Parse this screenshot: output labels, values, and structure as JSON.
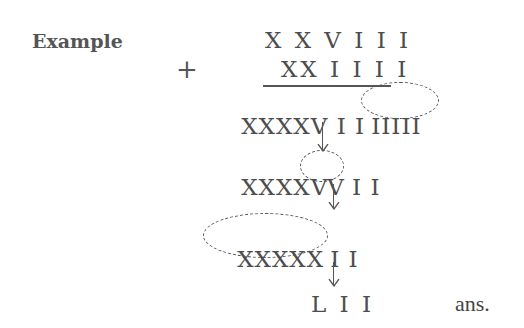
{
  "title": "Example",
  "operator": "+",
  "rows": {
    "addend1": "X X V I I I",
    "addend2": "XX I I I I",
    "sum_raw_prefix": "XXXXV I I",
    "sum_raw_circled": "IIIII",
    "step2_prefix": "XXXX",
    "step2_circled": "VV",
    "step2_suffix": "I I",
    "step3_circled": "XXXXX",
    "step3_suffix": "I I",
    "result": "L I I"
  },
  "answer_label": "ans.",
  "arrows": [
    {
      "name": "arrow-1",
      "glyph": "↓"
    },
    {
      "name": "arrow-2",
      "glyph": "↓"
    },
    {
      "name": "arrow-3",
      "glyph": "↓"
    }
  ],
  "colors": {
    "text": "#4d4d4d",
    "label": "#555555",
    "background": "#ffffff"
  }
}
